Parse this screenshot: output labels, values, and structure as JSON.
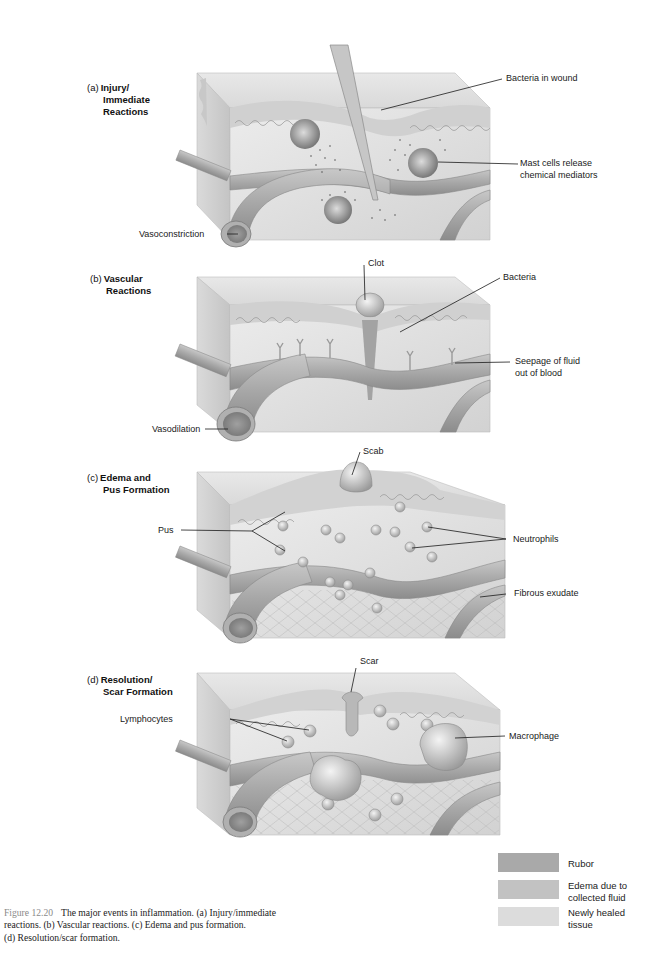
{
  "panels": [
    {
      "letter": "(a)",
      "title_lines": [
        "Injury/",
        "Immediate",
        "Reactions"
      ],
      "labels": {
        "bacteria_in_wound": "Bacteria in wound",
        "mast_cells_1": "Mast cells release",
        "mast_cells_2": "chemical mediators",
        "vasoconstriction": "Vasoconstriction"
      }
    },
    {
      "letter": "(b)",
      "title_lines": [
        "Vascular",
        "Reactions"
      ],
      "labels": {
        "clot": "Clot",
        "bacteria": "Bacteria",
        "seepage_1": "Seepage of fluid",
        "seepage_2": "out of blood",
        "vasodilation": "Vasodilation"
      }
    },
    {
      "letter": "(c)",
      "title_lines": [
        "Edema and",
        "Pus Formation"
      ],
      "labels": {
        "scab": "Scab",
        "pus": "Pus",
        "neutrophils": "Neutrophils",
        "fibrous_exudate": "Fibrous exudate"
      }
    },
    {
      "letter": "(d)",
      "title_lines": [
        "Resolution/",
        "Scar Formation"
      ],
      "labels": {
        "scar": "Scar",
        "lymphocytes": "Lymphocytes",
        "macrophage": "Macrophage"
      }
    }
  ],
  "legend": [
    {
      "label_lines": [
        "Rubor"
      ],
      "color": "#a9a9a9"
    },
    {
      "label_lines": [
        "Edema due to",
        "collected fluid"
      ],
      "color": "#c2c2c2"
    },
    {
      "label_lines": [
        "Newly healed",
        "tissue"
      ],
      "color": "#dcdcdc"
    }
  ],
  "caption": {
    "figure_number": "Figure 12.20",
    "text_line1": "The major events in inflammation. (a) Injury/immediate",
    "text_line2": "reactions. (b) Vascular reactions. (c) Edema and pus formation.",
    "text_line3": "(d) Resolution/scar formation."
  },
  "colors": {
    "block_front": "#e3e3e3",
    "block_top": "#d6d6d6",
    "block_side": "#cfcfcf",
    "vessel": "#b5b5b5",
    "vessel_dark": "#8f8f8f",
    "rubor": "#a9a9a9",
    "edema": "#c2c2c2",
    "healed": "#dcdcdc",
    "leader": "#1a1a1a"
  }
}
